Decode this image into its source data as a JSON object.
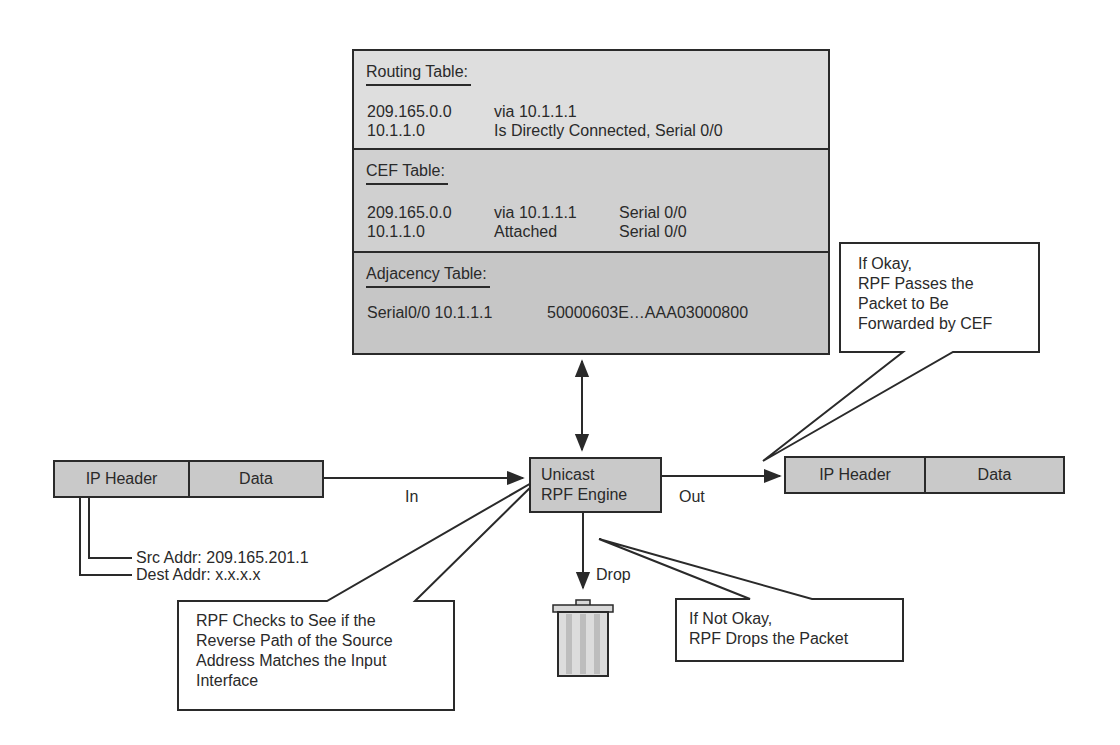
{
  "tables": {
    "routing": {
      "title": "Routing Table:",
      "rows": [
        {
          "prefix": "209.165.0.0",
          "next": "via 10.1.1.1"
        },
        {
          "prefix": "10.1.1.0",
          "next": "Is Directly Connected, Serial 0/0"
        }
      ]
    },
    "cef": {
      "title": "CEF Table:",
      "rows": [
        {
          "prefix": "209.165.0.0",
          "next": "via 10.1.1.1",
          "iface": "Serial 0/0"
        },
        {
          "prefix": "10.1.1.0",
          "next": "Attached",
          "iface": "Serial 0/0"
        }
      ]
    },
    "adjacency": {
      "title": "Adjacency Table:",
      "rows": [
        {
          "iface": "Serial0/0 10.1.1.1",
          "rewrite": "50000603E…AAA03000800"
        }
      ]
    }
  },
  "input_packet": {
    "header": "IP Header",
    "data": "Data"
  },
  "output_packet": {
    "header": "IP Header",
    "data": "Data"
  },
  "address_labels": {
    "src": "Src Addr:  209.165.201.1",
    "dest": "Dest Addr: x.x.x.x"
  },
  "engine": {
    "line1": "Unicast",
    "line2": "RPF Engine"
  },
  "flow_labels": {
    "in": "In",
    "out": "Out",
    "drop": "Drop"
  },
  "callouts": {
    "pass": [
      "If Okay,",
      "RPF Passes the",
      "Packet to Be",
      "Forwarded by CEF"
    ],
    "check": [
      "RPF Checks to See if the",
      "Reverse Path of the Source",
      "Address Matches the Input",
      "Interface"
    ],
    "drop": [
      "If Not Okay,",
      "RPF Drops the Packet"
    ]
  },
  "icons": {
    "trash": "trash-can-icon"
  },
  "colors": {
    "line": "#2a2a2a",
    "box_fill": "#c9c9c9",
    "table_s1": "#dedede",
    "table_s2": "#d0d0d0",
    "table_s3": "#c6c6c6"
  }
}
